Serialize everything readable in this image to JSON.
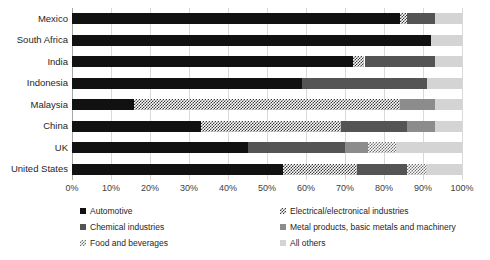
{
  "chart_data": {
    "type": "bar",
    "orientation": "horizontal",
    "stacked": true,
    "normalized_percent": true,
    "title": "",
    "xlabel": "",
    "ylabel": "",
    "xlim": [
      0,
      100
    ],
    "grid": true,
    "legend_position": "bottom",
    "categories": [
      "Mexico",
      "South Africa",
      "India",
      "Indonesia",
      "Malaysia",
      "China",
      "UK",
      "United States"
    ],
    "tick_labels": [
      "0%",
      "10%",
      "20%",
      "30%",
      "40%",
      "50%",
      "60%",
      "70%",
      "80%",
      "90%",
      "100%"
    ],
    "tick_values": [
      0,
      10,
      20,
      30,
      40,
      50,
      60,
      70,
      80,
      90,
      100
    ],
    "series": [
      {
        "name": "Automotive",
        "fill": "f-automotive",
        "color": "#111111",
        "values": [
          84,
          92,
          72,
          59,
          16,
          33,
          45,
          54
        ]
      },
      {
        "name": "Electrical/electronical industries",
        "fill": "f-electrical",
        "color": "#3a3a3a",
        "values": [
          2,
          0,
          3,
          0,
          68,
          36,
          0,
          19
        ]
      },
      {
        "name": "Chemical industries",
        "fill": "f-chemical",
        "color": "#545454",
        "values": [
          7,
          0,
          18,
          32,
          0,
          17,
          25,
          13
        ]
      },
      {
        "name": "Metal products, basic metals and machinery",
        "fill": "f-metal",
        "color": "#8c8c8c",
        "values": [
          0,
          0,
          0,
          0,
          9,
          7,
          6,
          0
        ]
      },
      {
        "name": "Food and beverages",
        "fill": "f-food",
        "color": "#6e6e6e",
        "values": [
          0,
          0,
          0,
          0,
          0,
          0,
          7,
          5
        ]
      },
      {
        "name": "All others",
        "fill": "f-others",
        "color": "#d4d4d4",
        "values": [
          7,
          8,
          7,
          9,
          7,
          7,
          17,
          9
        ]
      }
    ]
  },
  "legend": {
    "entries": [
      {
        "label": "Automotive",
        "fill": "f-automotive"
      },
      {
        "label": "Electrical/electronical industries",
        "fill": "f-electrical"
      },
      {
        "label": "Chemical industries",
        "fill": "f-chemical"
      },
      {
        "label": "Metal products, basic metals and machinery",
        "fill": "f-metal"
      },
      {
        "label": "Food and beverages",
        "fill": "f-food"
      },
      {
        "label": "All others",
        "fill": "f-others"
      }
    ]
  }
}
